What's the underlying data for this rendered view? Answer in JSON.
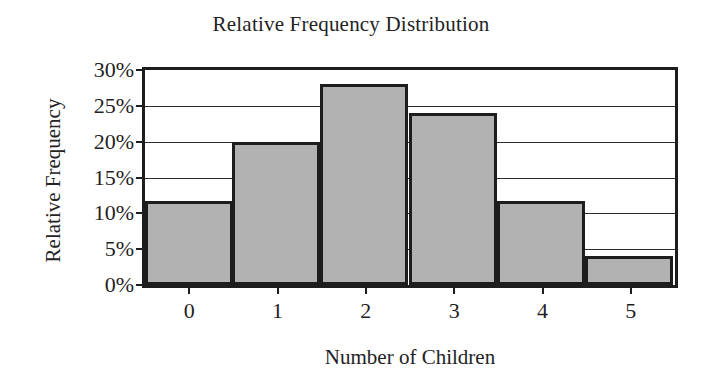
{
  "chart_data": {
    "type": "bar",
    "title": "Relative Frequency Distribution",
    "xlabel": "Number of Children",
    "ylabel": "Relative Frequency",
    "categories": [
      "0",
      "1",
      "2",
      "3",
      "4",
      "5"
    ],
    "values": [
      11.7,
      20.0,
      28.0,
      24.0,
      11.7,
      4.0
    ],
    "value_unit": "%",
    "ylim": [
      0,
      30
    ],
    "ytick_values": [
      0,
      5,
      10,
      15,
      20,
      25,
      30
    ],
    "ytick_labels": [
      "0%",
      "5%",
      "10%",
      "15%",
      "20%",
      "25%",
      "30%"
    ],
    "grid": true,
    "grid_axis": "y",
    "legend": false,
    "bar_fill_color": "#b2b2b2",
    "bar_edge_color": "#1d1d1d",
    "axis_color": "#1d1d1d",
    "background_color": "#ffffff",
    "bar_gap": 0,
    "style": "histogram"
  }
}
